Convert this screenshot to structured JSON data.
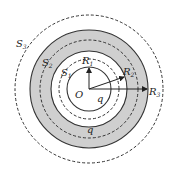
{
  "diagram": {
    "center_label": "O",
    "surfaces": [
      {
        "name": "S",
        "sub": "1",
        "style": "dashed"
      },
      {
        "name": "S",
        "sub": "2",
        "style": "dashed"
      },
      {
        "name": "S",
        "sub": "3",
        "style": "dashed"
      }
    ],
    "radii": [
      {
        "name": "R",
        "sub": "1"
      },
      {
        "name": "R",
        "sub": "2"
      },
      {
        "name": "R",
        "sub": "3"
      }
    ],
    "charges": {
      "inner_sphere": "q",
      "outer_shell": "q"
    },
    "colors": {
      "shell_fill": "#cfcfcf",
      "stroke": "#333333",
      "background": "#ffffff"
    }
  }
}
